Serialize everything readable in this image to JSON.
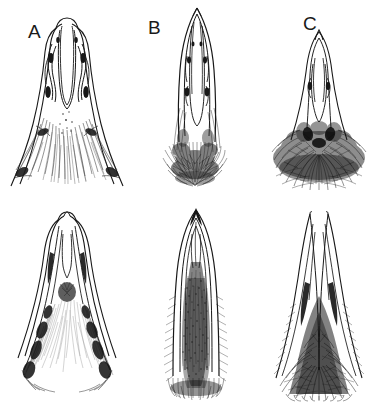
{
  "figure": {
    "kind": "scientific-illustration-plate",
    "medium": "pen-and-ink line drawing",
    "background_color": "#ffffff",
    "ink_color": "#181818",
    "width": 381,
    "height": 402,
    "rows": 2,
    "columns": 3,
    "panel_labels_visible": [
      "A",
      "B",
      "C"
    ],
    "caption": ""
  },
  "labels": {
    "a": "A",
    "b": "B",
    "c": "C"
  },
  "panels": [
    {
      "id": "a-top",
      "label": "A",
      "row": "top",
      "column": 1,
      "subject": "broad splayed forked structure with long sparse fringe of hairs",
      "outline_shape": "rounded-tip lobe flaring into wide V-shaped arms",
      "hair_density": "sparse-long",
      "hair_region": "lower half, trailing outward and downward"
    },
    {
      "id": "b-top",
      "label": "B",
      "row": "top",
      "column": 2,
      "subject": "narrow elongated pointed structure with dense basal hair skirt",
      "outline_shape": "lanceolate with acute apex and parallel sides",
      "hair_density": "dense-matted",
      "hair_region": "basal third, broad skirt"
    },
    {
      "id": "c-top",
      "label": "C",
      "row": "top",
      "column": 3,
      "subject": "slender tapering structure with very dense shaggy basal mass",
      "outline_shape": "narrow spike widening slightly at apex",
      "hair_density": "very-dense-shaggy",
      "hair_region": "basal quarter, wide mound"
    },
    {
      "id": "a-bottom",
      "label": "",
      "row": "bottom",
      "column": 1,
      "subject": "triangular forked structure with pale internal hair field",
      "outline_shape": "narrow V with rounded apex and splayed limbs",
      "hair_density": "sparse-fine",
      "hair_region": "central wedge and lower margins"
    },
    {
      "id": "b-bottom",
      "label": "",
      "row": "bottom",
      "column": 2,
      "subject": "elongate pointed structure filled with dense stippled pile",
      "outline_shape": "narrow ogive, acute apex, parallel sides",
      "hair_density": "dense-stippled",
      "hair_region": "full inner channel below apex"
    },
    {
      "id": "c-bottom",
      "label": "",
      "row": "bottom",
      "column": 3,
      "subject": "tapered structure with dark dense hair mass in lower triangle",
      "outline_shape": "narrow twin-pointed apex widening to broad base",
      "hair_density": "dense-coarse",
      "hair_region": "lower two-thirds, triangular"
    }
  ]
}
